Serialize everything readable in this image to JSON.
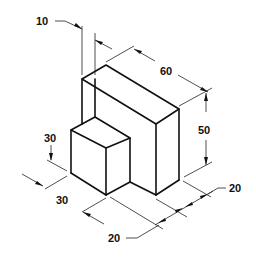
{
  "dimensions": {
    "top_offset": "10",
    "depth_top": "60",
    "height_large": "50",
    "height_small": "30",
    "width_small": "30",
    "bottom_left": "20",
    "bottom_right": "20"
  },
  "colors": {
    "line": "#111111",
    "background": "#ffffff"
  }
}
